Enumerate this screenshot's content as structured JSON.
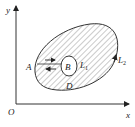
{
  "diagram": {
    "axes": {
      "x_label": "x",
      "y_label": "y",
      "origin_label": "O"
    },
    "regions": {
      "shaded_region": "D"
    },
    "curves": {
      "outer": "L",
      "outer_sub": "2",
      "inner": "L",
      "inner_sub": "1"
    },
    "points": {
      "a": "A",
      "b": "B"
    },
    "colors": {
      "stroke": "#333333",
      "hatch": "#8a8a8a",
      "background": "#ffffff"
    }
  }
}
